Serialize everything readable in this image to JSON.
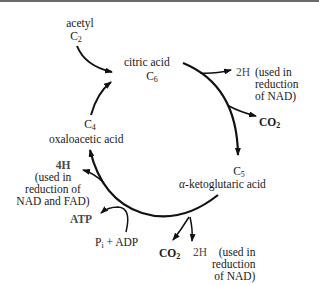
{
  "diagram": {
    "type": "cycle",
    "nodes": {
      "acetyl": {
        "name": "acetyl",
        "carbon": "C",
        "carbon_sub": "2"
      },
      "citric": {
        "name": "citric acid",
        "carbon": "C",
        "carbon_sub": "6"
      },
      "ketoglutaric": {
        "prefix": "α",
        "name": "-ketoglutaric acid",
        "carbon": "C",
        "carbon_sub": "5"
      },
      "oxaloacetic": {
        "name": "oxaloacetic acid",
        "carbon": "C",
        "carbon_sub": "4"
      }
    },
    "outputs": {
      "h2_top": {
        "label": "2H",
        "note_l1": "(used in",
        "note_l2": "reduction",
        "note_l3": "of NAD)"
      },
      "co2_top": {
        "label": "CO",
        "sub": "2"
      },
      "co2_bottom": {
        "label": "CO",
        "sub": "2"
      },
      "h2_bottom": {
        "label": "2H",
        "note_l1": "(used in",
        "note_l2": "reduction",
        "note_l3": "of NAD)"
      },
      "h4": {
        "label": "4H",
        "note_l1": "(used in",
        "note_l2": "reduction of",
        "note_l3": "NAD and FAD)"
      },
      "atp": {
        "label": "ATP"
      },
      "pi_adp": {
        "p": "P",
        "p_sub": "i",
        "rest": " + ADP"
      }
    },
    "colors": {
      "line": "#111111",
      "text": "#1a1a1a",
      "secondary_text": "#4a4a4a",
      "rule": "#6a6a6a"
    }
  }
}
